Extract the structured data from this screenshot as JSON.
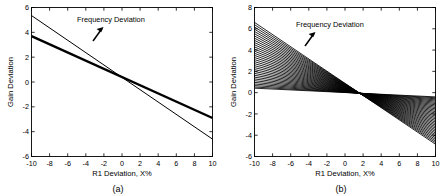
{
  "figure": {
    "panels": [
      {
        "caption": "(a)",
        "annotation": "Frequency Deviation",
        "arrow_icon": "up-right-arrow-icon",
        "xlabel": "R1 Deviation, X%",
        "ylabel": "Gain Deviation",
        "xticks": [
          "-10",
          "-8",
          "-6",
          "-4",
          "-2",
          "0",
          "2",
          "4",
          "6",
          "8",
          "10"
        ],
        "yticks": [
          "-6",
          "-4",
          "-2",
          "0",
          "2",
          "4",
          "6"
        ],
        "xlim": [
          -10,
          10
        ],
        "ylim": [
          -6,
          6
        ]
      },
      {
        "caption": "(b)",
        "annotation": "Frequency Deviation",
        "arrow_icon": "up-right-arrow-icon",
        "xlabel": "R1 Deviation, X%",
        "ylabel": "Gain Deviation",
        "xticks": [
          "-10",
          "-8",
          "-6",
          "-4",
          "-2",
          "0",
          "2",
          "4",
          "6",
          "8",
          "10"
        ],
        "yticks": [
          "-6",
          "-4",
          "-2",
          "0",
          "2",
          "4",
          "6",
          "8"
        ],
        "xlim": [
          -10,
          10
        ],
        "ylim": [
          -6,
          8
        ]
      }
    ]
  },
  "chart_data": [
    {
      "type": "line",
      "title": "",
      "subtitle": "(a)",
      "xlabel": "R1 Deviation, X%",
      "ylabel": "Gain Deviation",
      "xlim": [
        -10,
        10
      ],
      "ylim": [
        -6,
        6
      ],
      "xticks": [
        -10,
        -8,
        -6,
        -4,
        -2,
        0,
        2,
        4,
        6,
        8,
        10
      ],
      "yticks": [
        -6,
        -4,
        -2,
        0,
        2,
        4,
        6
      ],
      "grid": false,
      "legend": null,
      "annotations": [
        {
          "text": "Frequency Deviation",
          "x": -2.0,
          "y": 5.0
        },
        {
          "text": "",
          "icon": "up-right-arrow-icon",
          "x": -3.6,
          "y": 3.7
        }
      ],
      "x": [
        -10,
        10
      ],
      "series": [
        {
          "name": "thin-line",
          "linewidth": 1,
          "values": [
            5.35,
            -4.6
          ]
        },
        {
          "name": "thick-line",
          "linewidth": 2.4,
          "values": [
            3.7,
            -2.9
          ]
        }
      ],
      "notes": "Two straight lines crossing near x=1.5, y=-0.75"
    },
    {
      "type": "line",
      "title": "",
      "subtitle": "(b)",
      "xlabel": "R1 Deviation, X%",
      "ylabel": "Gain Deviation",
      "xlim": [
        -10,
        10
      ],
      "ylim": [
        -6,
        8
      ],
      "xticks": [
        -10,
        -8,
        -6,
        -4,
        -2,
        0,
        2,
        4,
        6,
        8,
        10
      ],
      "yticks": [
        -6,
        -4,
        -2,
        0,
        2,
        4,
        6,
        8
      ],
      "grid": false,
      "legend": null,
      "annotations": [
        {
          "text": "Frequency Deviation",
          "x": -2.2,
          "y": 6.4
        },
        {
          "text": "",
          "icon": "up-right-arrow-icon",
          "x": -4.3,
          "y": 4.9
        }
      ],
      "x": [
        -10,
        10
      ],
      "fan": {
        "pivot_x": 0.8,
        "pivot_y": 0.0,
        "y_at_xmin_range": [
          0.42,
          6.6
        ],
        "y_at_xmax_range": [
          -0.4,
          -4.85
        ],
        "n_lines": 34
      },
      "notes": "Fan of ~34 straight lines all passing through a common pivot near (0.8, 0); slopes vary monotonically."
    }
  ]
}
